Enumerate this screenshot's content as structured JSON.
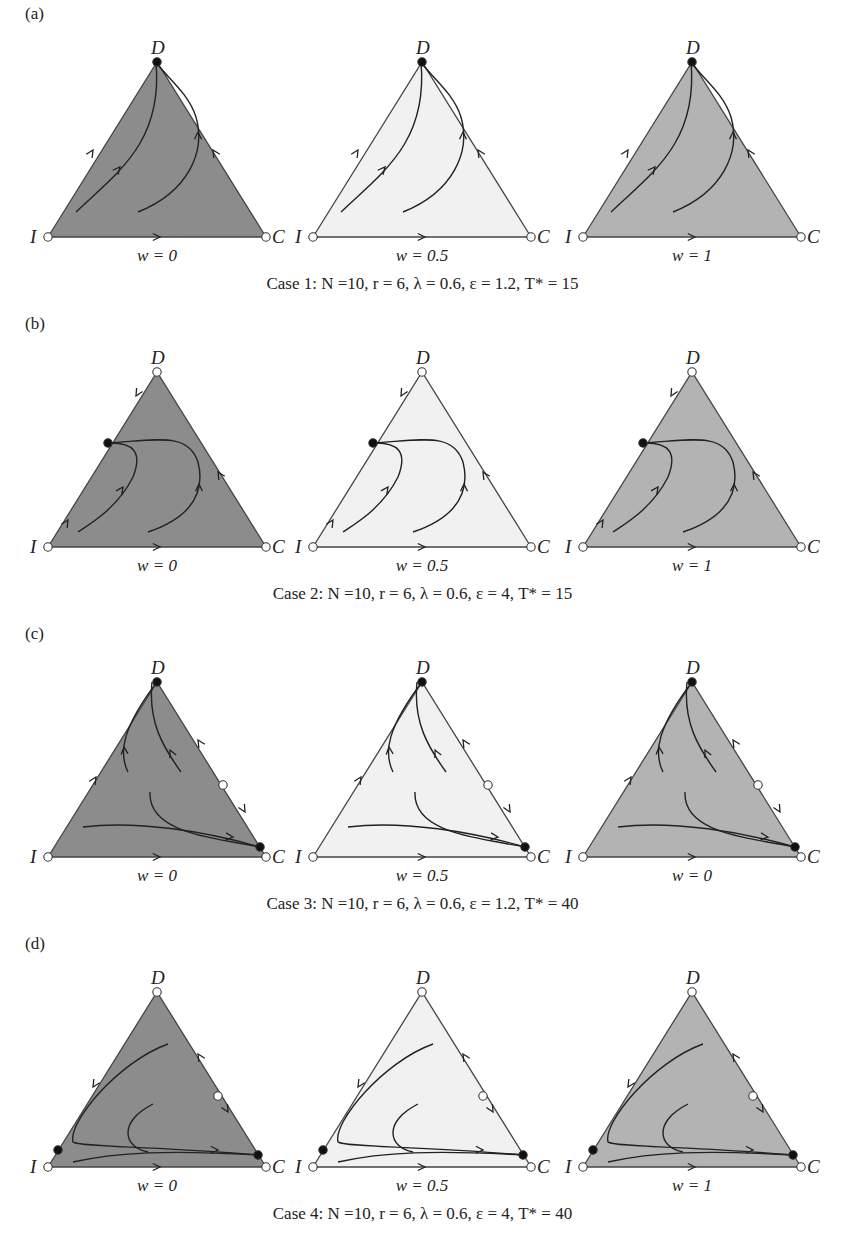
{
  "figure": {
    "fills": {
      "dark": "#8c8c8c",
      "light": "#f1f1f1",
      "medium": "#b3b3b3"
    },
    "vertex_labels": {
      "top": "D",
      "left": "I",
      "right": "C"
    },
    "rows": [
      {
        "panel": "(a)",
        "caption": "Case 1: N =10, r = 6, λ = 0.6, ε = 1.2, T* = 15",
        "params": {
          "N": 10,
          "r": 6,
          "lambda": 0.6,
          "epsilon": 1.2,
          "T_star": 15
        },
        "panels": [
          {
            "w_label": "w = 0",
            "fill": "dark"
          },
          {
            "w_label": "w = 0.5",
            "fill": "light"
          },
          {
            "w_label": "w = 1",
            "fill": "medium"
          }
        ],
        "equilibria": "D stable (filled); I, C unstable (open)"
      },
      {
        "panel": "(b)",
        "caption": "Case 2: N =10, r = 6, λ = 0.6, ε = 4, T* = 15",
        "params": {
          "N": 10,
          "r": 6,
          "lambda": 0.6,
          "epsilon": 4,
          "T_star": 15
        },
        "panels": [
          {
            "w_label": "w = 0",
            "fill": "dark"
          },
          {
            "w_label": "w = 0.5",
            "fill": "light"
          },
          {
            "w_label": "w = 1",
            "fill": "medium"
          }
        ],
        "equilibria": "Stable point on I–D edge; D, I, C unstable (open)"
      },
      {
        "panel": "(c)",
        "caption": "Case 3: N =10, r = 6, λ = 0.6, ε = 1.2, T* = 40",
        "params": {
          "N": 10,
          "r": 6,
          "lambda": 0.6,
          "epsilon": 1.2,
          "T_star": 40
        },
        "panels": [
          {
            "w_label": "w = 0",
            "fill": "dark"
          },
          {
            "w_label": "w = 0.5",
            "fill": "light"
          },
          {
            "w_label": "w = 0",
            "fill": "medium"
          }
        ],
        "equilibria": "D stable, stable point near C on D–C edge; saddle on D–C edge; I, C open"
      },
      {
        "panel": "(d)",
        "caption": "Case 4: N =10, r = 6, λ = 0.6, ε = 4, T* = 40",
        "params": {
          "N": 10,
          "r": 6,
          "lambda": 0.6,
          "epsilon": 4,
          "T_star": 40
        },
        "panels": [
          {
            "w_label": "w = 0",
            "fill": "dark",
            "left_label": "I"
          },
          {
            "w_label": "w = 0.5",
            "fill": "light"
          },
          {
            "w_label": "w = 1",
            "fill": "medium"
          }
        ],
        "equilibria": "Stable points near I on I–D edge and near C on D–C edge; D, I, C and D–C saddle open"
      }
    ]
  }
}
